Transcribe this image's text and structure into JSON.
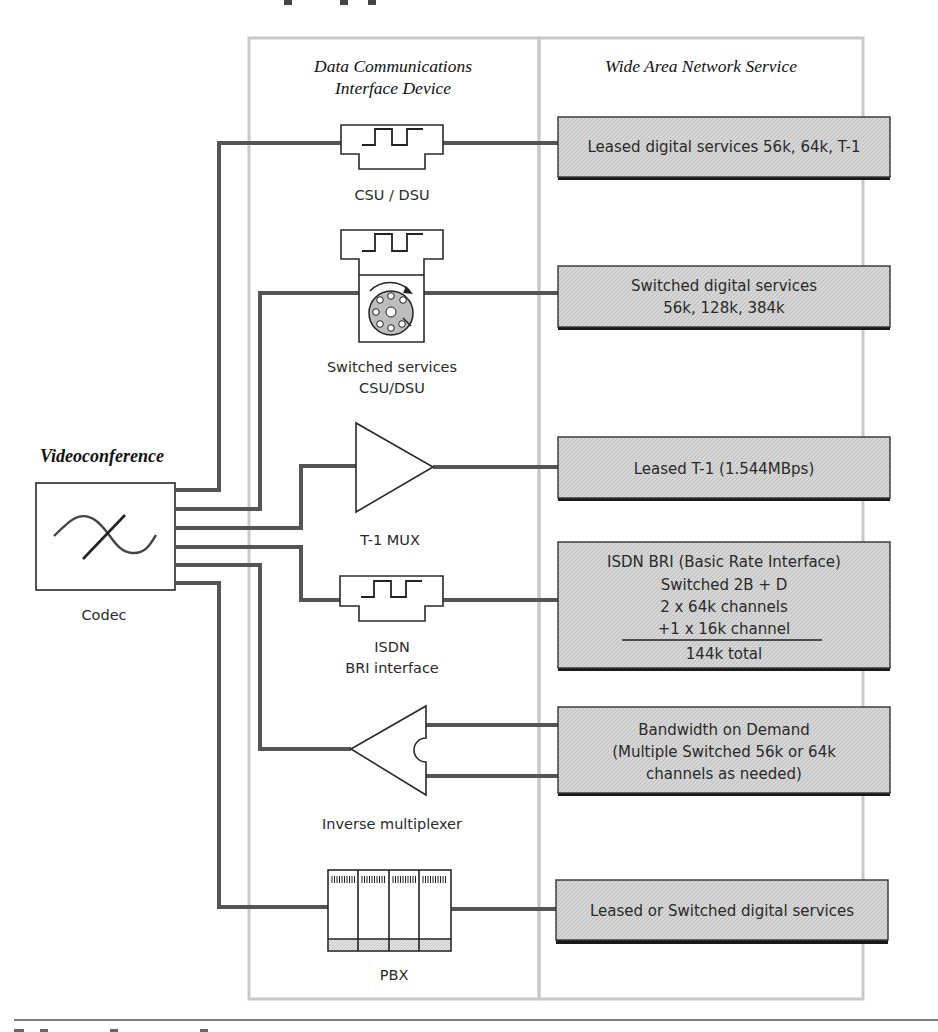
{
  "figure": {
    "section_headers": {
      "left": "Data Communications",
      "left_line2": "Interface Device",
      "right": "Wide Area Network Service"
    },
    "source": {
      "title": "Videoconference",
      "device_label": "Codec"
    },
    "devices": [
      {
        "id": "csu-dsu",
        "label": "CSU / DSU",
        "icon": "square-wave-icon"
      },
      {
        "id": "switched-csu-dsu",
        "label": "Switched services",
        "label_line2": "CSU/DSU",
        "icon": "dial-icon"
      },
      {
        "id": "t1-mux",
        "label": "T-1 MUX",
        "icon": "triangle-mux-icon"
      },
      {
        "id": "isdn-bri",
        "label": "ISDN",
        "label_line2": "BRI interface",
        "icon": "square-wave-icon"
      },
      {
        "id": "inverse-mux",
        "label": "Inverse multiplexer",
        "icon": "inverse-triangle-icon"
      },
      {
        "id": "pbx",
        "label": "PBX",
        "icon": "pbx-cabinet-icon"
      }
    ],
    "services": [
      {
        "lines": [
          "Leased digital services 56k, 64k, T-1"
        ]
      },
      {
        "lines": [
          "Switched digital services",
          "56k, 128k, 384k"
        ]
      },
      {
        "lines": [
          "Leased T-1 (1.544MBps)"
        ]
      },
      {
        "lines": [
          "ISDN BRI (Basic Rate Interface)",
          "Switched 2B + D",
          "2 x 64k channels",
          "+1 x 16k channel",
          "144k total"
        ]
      },
      {
        "lines": [
          "Bandwidth on Demand",
          "(Multiple Switched 56k or 64k",
          "channels as needed)"
        ]
      },
      {
        "lines": [
          "Leased or Switched digital services"
        ]
      }
    ],
    "colors": {
      "wire": "#555555",
      "panel_border": "#c9c9c9",
      "service_fill": "#d4d4d4",
      "service_shadow": "#1a1a1a"
    }
  }
}
